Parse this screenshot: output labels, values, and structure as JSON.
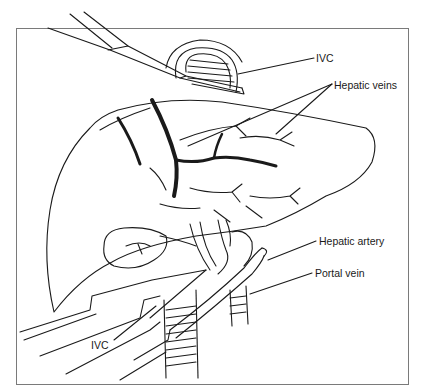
{
  "figure": {
    "type": "surgical anatomical illustration",
    "labels": [
      {
        "id": "ivc-top",
        "text": "IVC",
        "x": 316,
        "y": 52
      },
      {
        "id": "hepatic-veins",
        "text": "Hepatic veins",
        "x": 334,
        "y": 79
      },
      {
        "id": "hepatic-artery",
        "text": "Hepatic artery",
        "x": 319,
        "y": 235
      },
      {
        "id": "portal-vein",
        "text": "Portal vein",
        "x": 315,
        "y": 267
      },
      {
        "id": "ivc-bottom",
        "text": "IVC",
        "x": 91,
        "y": 339
      }
    ],
    "colors": {
      "ink": "#1a1a1a",
      "frame": "#7a7a7a",
      "background": "#ffffff"
    }
  }
}
